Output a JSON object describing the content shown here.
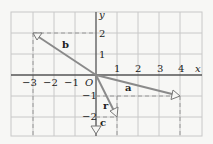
{
  "diagram": {
    "axes": {
      "x_label": "x",
      "y_label": "y",
      "origin_label": "O",
      "x_ticks": [
        "−3",
        "−2",
        "−1",
        "1",
        "2",
        "3",
        "4"
      ],
      "y_ticks": [
        "2",
        "1",
        "−1",
        "−2"
      ]
    },
    "vectors": [
      {
        "name": "a",
        "label": "a",
        "x": 4,
        "y": -1
      },
      {
        "name": "b",
        "label": "b",
        "x": -3,
        "y": 2
      },
      {
        "name": "c",
        "label": "c",
        "x": 0,
        "y": -3
      },
      {
        "name": "r",
        "label": "r",
        "x": 1,
        "y": -2
      }
    ],
    "colors": {
      "grid": "#c8c8c8",
      "axis": "#555555",
      "vector": "#8a8a8a",
      "background": "#f7f7f5"
    }
  }
}
